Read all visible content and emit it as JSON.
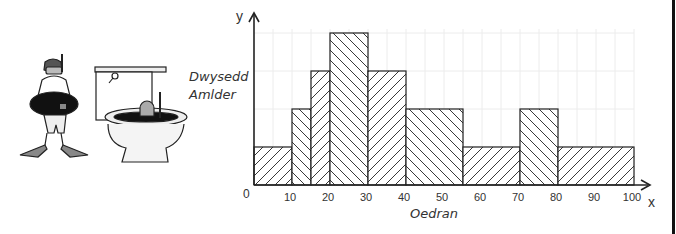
{
  "chart_data": {
    "type": "bar",
    "subtype": "histogram",
    "title": "",
    "xlabel": "Oedran",
    "ylabel": "Dwysedd Amlder",
    "x_axis_symbol": "x",
    "y_axis_symbol": "y",
    "origin_label": "0",
    "xlim": [
      0,
      100
    ],
    "ylim": [
      0,
      4
    ],
    "grid": true,
    "x_ticks": [
      10,
      20,
      30,
      40,
      50,
      60,
      70,
      80,
      90,
      100
    ],
    "bins": [
      {
        "from": 0,
        "to": 10,
        "density": 1
      },
      {
        "from": 10,
        "to": 15,
        "density": 2
      },
      {
        "from": 15,
        "to": 20,
        "density": 3
      },
      {
        "from": 20,
        "to": 30,
        "density": 4
      },
      {
        "from": 30,
        "to": 40,
        "density": 3
      },
      {
        "from": 40,
        "to": 55,
        "density": 2
      },
      {
        "from": 55,
        "to": 70,
        "density": 1
      },
      {
        "from": 70,
        "to": 80,
        "density": 2
      },
      {
        "from": 80,
        "to": 100,
        "density": 1
      }
    ],
    "categories": [
      "0-10",
      "10-15",
      "15-20",
      "20-30",
      "30-40",
      "40-55",
      "55-70",
      "70-80",
      "80-100"
    ],
    "values": [
      1,
      2,
      3,
      4,
      3,
      2,
      1,
      2,
      1
    ],
    "hatch": [
      "fwd",
      "back",
      "fwd",
      "back",
      "fwd",
      "back",
      "fwd",
      "back",
      "fwd"
    ]
  },
  "labels": {
    "ylabel_line1": "Dwysedd",
    "ylabel_line2": "Amlder"
  },
  "illustration": {
    "description": "Cartoon of a snorkeler with swim ring and flippers next to a toilet with a snorkeler inside"
  }
}
